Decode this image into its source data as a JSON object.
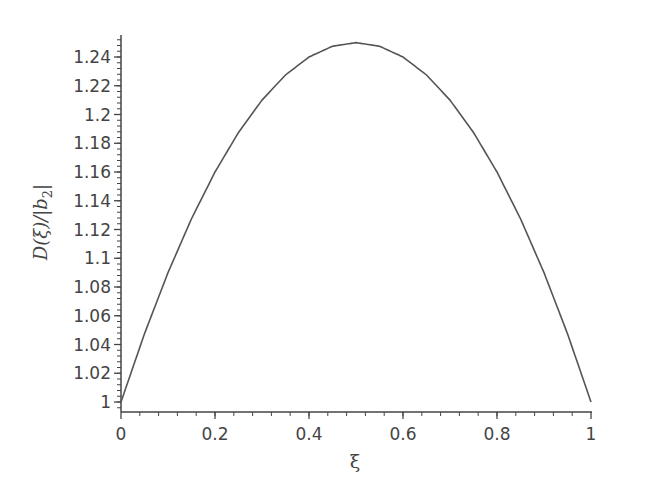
{
  "chart_data": {
    "type": "line",
    "title": "",
    "xlabel": "ξ",
    "ylabel": "D(ξ)/|b₂|",
    "ylabel_parts": {
      "main": "D(ξ)/|",
      "var": "b",
      "sub": "2",
      "end": "|"
    },
    "xlim": [
      0,
      1
    ],
    "ylim": [
      0.995,
      1.255
    ],
    "grid": false,
    "legend": null,
    "x_ticks": [
      0,
      0.2,
      0.4,
      0.6,
      0.8,
      1
    ],
    "x_tick_labels": [
      "0",
      "0.2",
      "0.4",
      "0.6",
      "0.8",
      "1"
    ],
    "y_ticks": [
      1,
      1.02,
      1.04,
      1.06,
      1.08,
      1.1,
      1.12,
      1.14,
      1.16,
      1.18,
      1.2,
      1.22,
      1.24
    ],
    "y_tick_labels": [
      "1",
      "1.02",
      "1.04",
      "1.06",
      "1.08",
      "1.1",
      "1.12",
      "1.14",
      "1.16",
      "1.18",
      "1.2",
      "1.22",
      "1.24"
    ],
    "series": [
      {
        "name": "D(ξ)/|b2|",
        "x": [
          0,
          0.05,
          0.1,
          0.15,
          0.2,
          0.25,
          0.3,
          0.35,
          0.4,
          0.45,
          0.5,
          0.55,
          0.6,
          0.65,
          0.7,
          0.75,
          0.8,
          0.85,
          0.9,
          0.95,
          1
        ],
        "values": [
          1.0,
          1.0475,
          1.09,
          1.1275,
          1.16,
          1.1875,
          1.21,
          1.2275,
          1.24,
          1.2475,
          1.25,
          1.2475,
          1.24,
          1.2275,
          1.21,
          1.1875,
          1.16,
          1.1275,
          1.09,
          1.0475,
          1.0
        ],
        "color": "#555555"
      }
    ]
  },
  "colors": {
    "axis": "#444444",
    "line": "#555555",
    "text": "#444444"
  }
}
